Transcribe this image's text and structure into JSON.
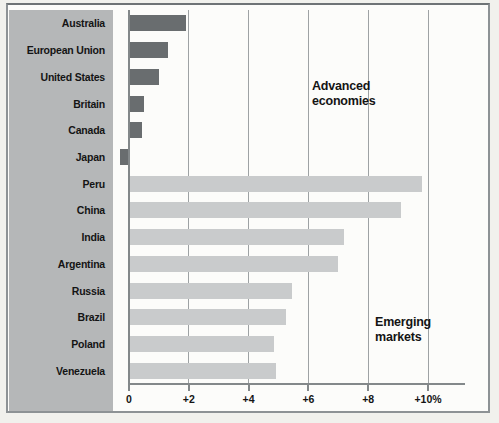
{
  "chart_data": {
    "type": "bar",
    "orientation": "horizontal",
    "title": "",
    "categories": [
      "Australia",
      "European Union",
      "United States",
      "Britain",
      "Canada",
      "Japan",
      "Peru",
      "China",
      "India",
      "Argentina",
      "Russia",
      "Brazil",
      "Poland",
      "Venezuela"
    ],
    "values": [
      1.9,
      1.3,
      1.0,
      0.5,
      0.45,
      -0.3,
      9.8,
      9.1,
      7.2,
      7.0,
      5.45,
      5.25,
      4.85,
      4.9
    ],
    "group_of_each": [
      "advanced",
      "advanced",
      "advanced",
      "advanced",
      "advanced",
      "advanced",
      "emerging",
      "emerging",
      "emerging",
      "emerging",
      "emerging",
      "emerging",
      "emerging",
      "emerging"
    ],
    "groups": {
      "advanced": {
        "label": "Advanced economies",
        "color": "#696d6f"
      },
      "emerging": {
        "label": "Emerging markets",
        "color": "#c9cbcc"
      }
    },
    "annotations": [
      {
        "lines": [
          "Advanced",
          "economies"
        ],
        "x": 312,
        "y": 79
      },
      {
        "lines": [
          "Emerging",
          "markets"
        ],
        "x": 375,
        "y": 315
      }
    ],
    "x_axis": {
      "tick_values": [
        0,
        2,
        4,
        6,
        8,
        10
      ],
      "tick_labels": [
        "0",
        "+2",
        "+4",
        "+6",
        "+8",
        "+10%"
      ],
      "min": 0,
      "max": 10,
      "unit": "percent change"
    },
    "grid": true,
    "legend": "none"
  },
  "colors": {
    "page_bg": "#f1f1ed",
    "chart_bg": "#fcfcfa",
    "frame_border": "#8d9295",
    "sidebar_bg": "#b5b7b8",
    "gridline": "#9ea2a4",
    "axis": "#83888a",
    "advanced_bar": "#696d6f",
    "emerging_bar": "#c9cbcc",
    "text": "#141414"
  }
}
